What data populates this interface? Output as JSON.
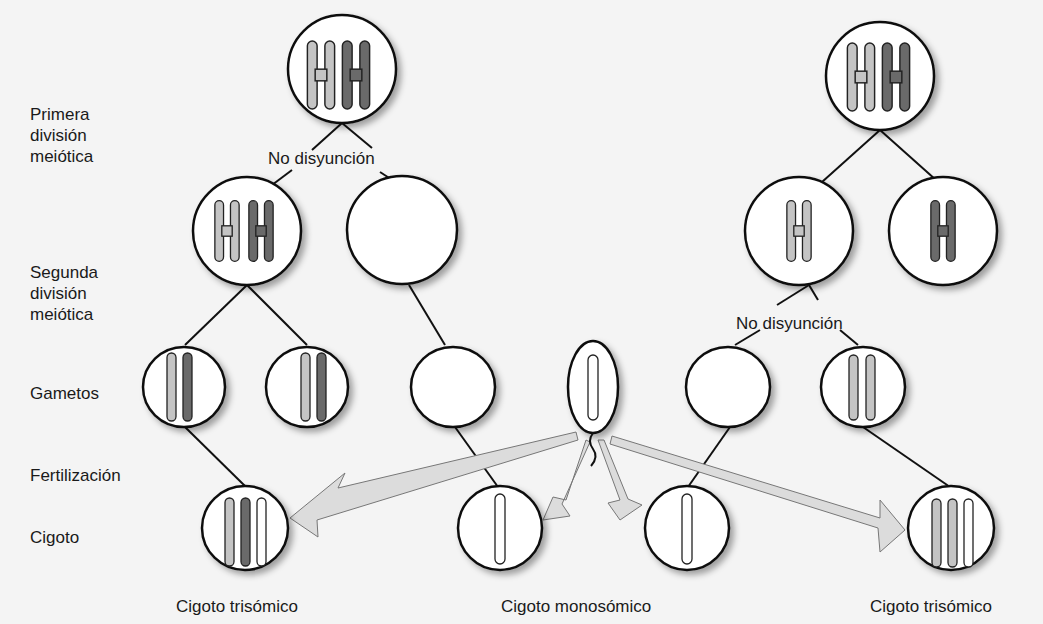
{
  "stage_labels": {
    "first_division": [
      "Primera",
      "división",
      "meiótica"
    ],
    "second_division": [
      "Segunda",
      "división",
      "meiótica"
    ],
    "gametes": "Gametos",
    "fertilization": "Fertilización",
    "zygote": "Cigoto"
  },
  "annotations": {
    "left_nondisjunction": "No disyunción",
    "right_nondisjunction": "No disyunción"
  },
  "zygote_labels": {
    "left": "Cigoto trisómico",
    "middle": "Cigoto monosómico",
    "right": "Cigoto trisómico"
  },
  "colors": {
    "light_chromosome": "#c4c4c4",
    "dark_chromosome": "#6a6a6a",
    "white_chromosome": "#ffffff",
    "outline": "#111111",
    "arrow_fill": "#dcdcdc",
    "background": "#f4f4f4"
  }
}
